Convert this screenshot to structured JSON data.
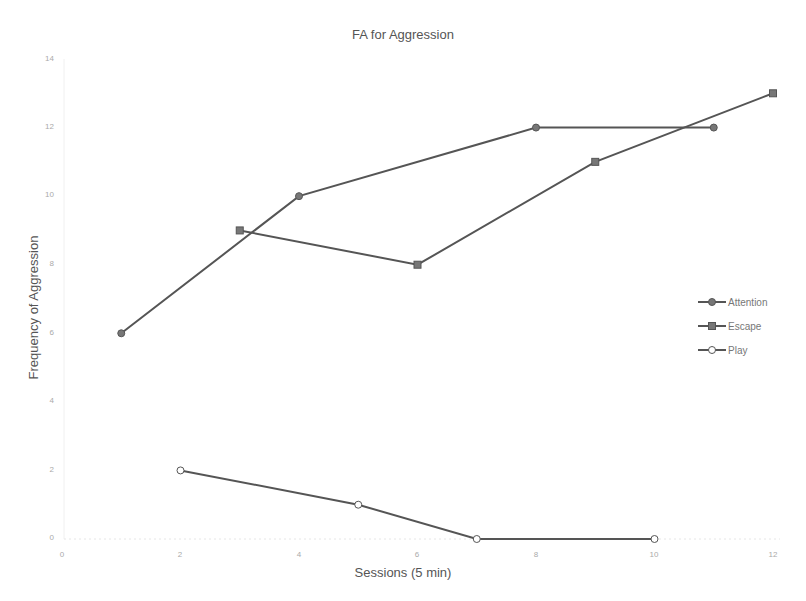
{
  "chart_data": {
    "type": "line",
    "title": "FA for Aggression",
    "xlabel": "Sessions (5 min)",
    "ylabel": "Frequency of Aggression",
    "xlim": [
      0,
      12
    ],
    "ylim": [
      0,
      14
    ],
    "x_ticks": [
      "0",
      "2",
      "4",
      "6",
      "8",
      "10",
      "12"
    ],
    "y_ticks": [
      "0",
      "2",
      "4",
      "6",
      "8",
      "10",
      "12",
      "14"
    ],
    "grid": false,
    "legend_position": "right",
    "series": [
      {
        "name": "Attention",
        "marker": "circle-filled",
        "color": "#555555",
        "x": [
          1,
          4,
          8,
          11
        ],
        "y": [
          6,
          10,
          12,
          12
        ]
      },
      {
        "name": "Escape",
        "marker": "square-filled",
        "color": "#555555",
        "x": [
          3,
          6,
          9,
          12
        ],
        "y": [
          9,
          8,
          11,
          13
        ]
      },
      {
        "name": "Play",
        "marker": "circle-open",
        "color": "#555555",
        "x": [
          2,
          5,
          7,
          10
        ],
        "y": [
          2,
          1,
          0,
          0
        ]
      }
    ]
  }
}
